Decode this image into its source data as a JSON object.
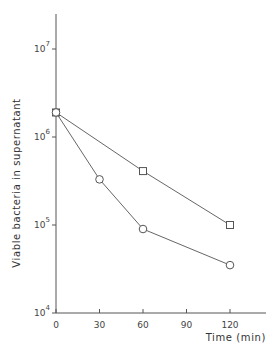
{
  "chart_data": {
    "type": "line",
    "title": "",
    "xlabel": "Time (min)",
    "ylabel": "Viable bacteria in supernatant",
    "xlim": [
      0,
      140
    ],
    "ylim": [
      10000,
      20000000
    ],
    "yscale": "log",
    "grid": false,
    "legend": "none",
    "x_ticks": [
      0,
      30,
      60,
      90,
      120
    ],
    "x_tick_labels": [
      "0",
      "30",
      "60",
      "90",
      "120"
    ],
    "y_ticks": [
      10000,
      100000,
      1000000,
      10000000
    ],
    "y_tick_labels": [
      {
        "base": "10",
        "exp": "4"
      },
      {
        "base": "10",
        "exp": "5"
      },
      {
        "base": "10",
        "exp": "6"
      },
      {
        "base": "10",
        "exp": "7"
      }
    ],
    "series": [
      {
        "name": "square-series",
        "marker": "square",
        "x": [
          0,
          60,
          120
        ],
        "values": [
          1900000,
          410000,
          100000
        ]
      },
      {
        "name": "circle-series",
        "marker": "circle",
        "x": [
          0,
          30,
          60,
          120
        ],
        "values": [
          1900000,
          330000,
          90000,
          35000
        ]
      }
    ]
  }
}
